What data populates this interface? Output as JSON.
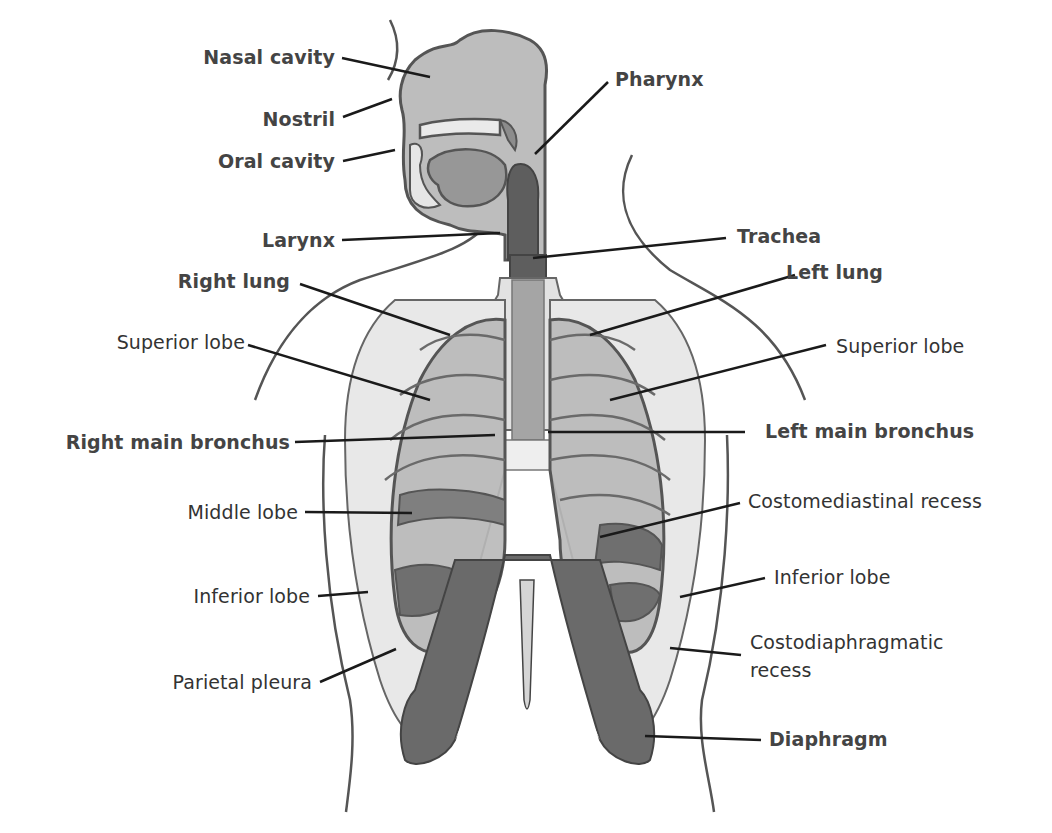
{
  "diagram": {
    "colors": {
      "background": "#ffffff",
      "outline": "#555555",
      "light_tissue": "#e6e6e6",
      "lung": "#b8b8b8",
      "lung_dark": "#8a8a8a",
      "airway_dark": "#5e5e5e",
      "diaphragm": "#6a6a6a",
      "leader_line": "#1a1a1a",
      "label_text": "#333333"
    },
    "labels": {
      "nasal_cavity": "Nasal cavity",
      "nostril": "Nostril",
      "oral_cavity": "Oral cavity",
      "pharynx": "Pharynx",
      "larynx": "Larynx",
      "trachea": "Trachea",
      "right_lung": "Right lung",
      "left_lung": "Left lung",
      "superior_lobe_right": "Superior lobe",
      "superior_lobe_left": "Superior lobe",
      "right_main_bronchus": "Right main bronchus",
      "left_main_bronchus": "Left main bronchus",
      "middle_lobe": "Middle lobe",
      "costomediastinal_recess": "Costomediastinal recess",
      "inferior_lobe_right": "Inferior lobe",
      "inferior_lobe_left": "Inferior lobe",
      "parietal_pleura": "Parietal pleura",
      "costodiaphragmatic_recess": "Costodiaphragmatic recess",
      "diaphragm": "Diaphragm"
    }
  }
}
